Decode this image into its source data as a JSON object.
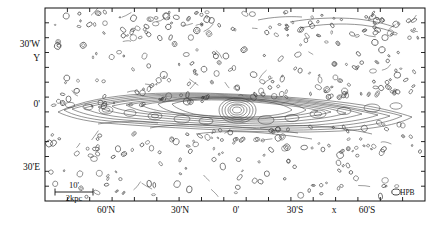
{
  "figure": {
    "kind": "radio-contour-map",
    "plot_frame": {
      "left": 45,
      "top": 8,
      "right": 425,
      "bottom": 201
    },
    "frame_color": "#111111",
    "contour_color": "#3a3a3a",
    "background": "#ffffff"
  },
  "chart_data": {
    "type": "contour",
    "title": "",
    "xlabel": "x",
    "ylabel": "Y",
    "grid": false,
    "legend": null,
    "x_axis": {
      "tick_labels": [
        "60'N",
        "30'N",
        "0'",
        "30'S",
        "60'S"
      ],
      "tick_label_positions_px": [
        105,
        180,
        236,
        295,
        365
      ],
      "minor_tick_count": 17,
      "direction": "N to S (left to right)"
    },
    "y_axis": {
      "tick_labels": [
        "30'W",
        "0'",
        "30'E"
      ],
      "tick_label_positions_px": [
        45,
        105,
        168
      ],
      "minor_tick_count": 13,
      "direction": "W to E (top to bottom)"
    },
    "annotations": [
      {
        "name": "scalebar-angular",
        "text": "10'"
      },
      {
        "name": "scalebar-physical",
        "text": "2kpc"
      },
      {
        "name": "beam-label",
        "text": "HPB"
      }
    ],
    "features": [
      {
        "name": "nucleus",
        "center_px": [
          236,
          110
        ],
        "description": "compact bright core with nested closed contours"
      },
      {
        "name": "inner-disk",
        "description": "elongated horizontal contour envelope spanning the frame"
      },
      {
        "name": "halo-noise",
        "description": "dense field of small closed noise contours above and below the disk"
      }
    ]
  },
  "labels": {
    "y_30w": "30'W",
    "y_symbol": "Y",
    "y_0": "0'",
    "y_30e": "30'E",
    "x_60n": "60'N",
    "x_30n": "30'N",
    "x_0": "0'",
    "x_30s": "30'S",
    "x_symbol": "x",
    "x_60s": "60'S",
    "scale_angular": "10'",
    "scale_physical": "2kpc",
    "beam": "HPB"
  }
}
